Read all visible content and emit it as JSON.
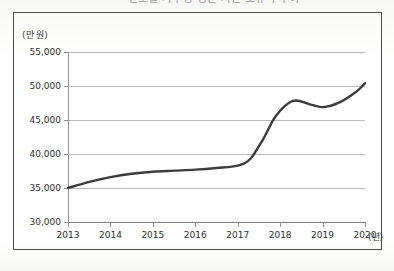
{
  "page": {
    "title_partial": "연도별 가구당 평균 자산 보유액 추이",
    "background_color": "#fdfdfc",
    "frame_color": "#4a4a4a"
  },
  "chart_data": {
    "type": "line",
    "title": "연도별 가구당 평균 자산 보유액 추이",
    "xlabel": "(년)",
    "ylabel": "(만 원)",
    "x": [
      2013,
      2014,
      2015,
      2016,
      2017,
      2018,
      2019,
      2020
    ],
    "categories": [
      "2013",
      "2014",
      "2015",
      "2016",
      "2017",
      "2018",
      "2019",
      "2020"
    ],
    "values": [
      35000,
      36600,
      37400,
      37700,
      38300,
      47600,
      46900,
      50400
    ],
    "series": [
      {
        "name": "가구당 평균 자산",
        "values": [
          35000,
          36600,
          37400,
          37700,
          38300,
          47600,
          46900,
          50400
        ]
      }
    ],
    "ylim": [
      30000,
      55000
    ],
    "yticks": [
      30000,
      35000,
      40000,
      45000,
      50000,
      55000
    ],
    "ytick_labels": [
      "30,000",
      "35,000",
      "40,000",
      "45,000",
      "50,000",
      "55,000"
    ],
    "xtick_labels": [
      "2013",
      "2014",
      "2015",
      "2016",
      "2017",
      "2018",
      "2019",
      "2020"
    ],
    "grid": true,
    "grid_axis": "y",
    "legend": false,
    "line_color": "#3c3c3c",
    "line_width": 2.4,
    "markers": false,
    "annotations": [
      {
        "label": "local peak",
        "x": 2018.3,
        "y": 47800
      },
      {
        "label": "local dip",
        "x": 2019.0,
        "y": 46900
      }
    ],
    "curve_points": [
      [
        2013.0,
        35000
      ],
      [
        2013.5,
        35900
      ],
      [
        2014.0,
        36600
      ],
      [
        2014.5,
        37100
      ],
      [
        2015.0,
        37400
      ],
      [
        2015.5,
        37550
      ],
      [
        2016.0,
        37700
      ],
      [
        2016.5,
        37950
      ],
      [
        2017.0,
        38300
      ],
      [
        2017.3,
        39300
      ],
      [
        2017.6,
        42200
      ],
      [
        2017.9,
        45600
      ],
      [
        2018.3,
        47800
      ],
      [
        2018.7,
        47300
      ],
      [
        2019.0,
        46900
      ],
      [
        2019.4,
        47600
      ],
      [
        2019.8,
        49200
      ],
      [
        2020.0,
        50400
      ]
    ]
  },
  "axes": {
    "y_unit_label": "(만 원)",
    "x_unit_label": "(년)"
  }
}
